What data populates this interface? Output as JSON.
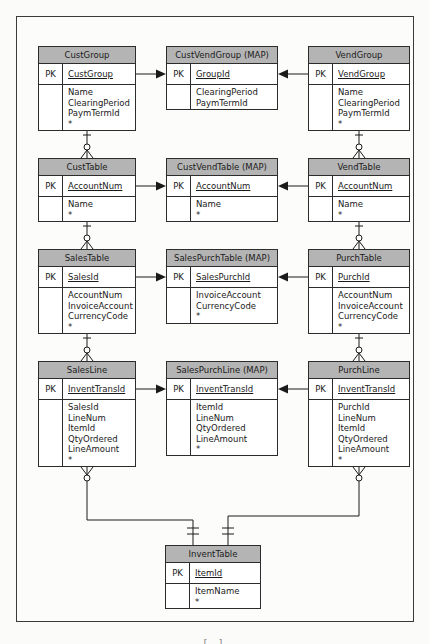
{
  "pk_label": "PK",
  "footer_fragment": "[ ]",
  "entities": [
    {
      "id": "custgroup",
      "name": "CustGroup",
      "pk": "CustGroup",
      "attrs": [
        "Name",
        "ClearingPeriod",
        "PaymTermId",
        "*"
      ]
    },
    {
      "id": "custvendgroup",
      "name": "CustVendGroup (MAP)",
      "pk": "GroupId",
      "attrs": [
        "ClearingPeriod",
        "PaymTermId"
      ]
    },
    {
      "id": "vendgroup",
      "name": "VendGroup",
      "pk": "VendGroup",
      "attrs": [
        "Name",
        "ClearingPeriod",
        "PaymTermId",
        "*"
      ]
    },
    {
      "id": "custtable",
      "name": "CustTable",
      "pk": "AccountNum",
      "attrs": [
        "Name",
        "*"
      ]
    },
    {
      "id": "custvendtable",
      "name": "CustVendTable (MAP)",
      "pk": "AccountNum",
      "attrs": [
        "Name",
        "*"
      ]
    },
    {
      "id": "vendtable",
      "name": "VendTable",
      "pk": "AccountNum",
      "attrs": [
        "Name",
        "*"
      ]
    },
    {
      "id": "salestable",
      "name": "SalesTable",
      "pk": "SalesId",
      "attrs": [
        "AccountNum",
        "InvoiceAccount",
        "CurrencyCode",
        "*"
      ]
    },
    {
      "id": "salespurchtable",
      "name": "SalesPurchTable (MAP)",
      "pk": "SalesPurchId",
      "attrs": [
        "InvoiceAccount",
        "CurrencyCode",
        "*"
      ]
    },
    {
      "id": "purchtable",
      "name": "PurchTable",
      "pk": "PurchId",
      "attrs": [
        "AccountNum",
        "InvoiceAccount",
        "CurrencyCode",
        "*"
      ]
    },
    {
      "id": "salesline",
      "name": "SalesLine",
      "pk": "InventTransId",
      "attrs": [
        "SalesId",
        "LineNum",
        "ItemId",
        "QtyOrdered",
        "LineAmount",
        "*"
      ]
    },
    {
      "id": "salespurchline",
      "name": "SalesPurchLine (MAP)",
      "pk": "InventTransId",
      "attrs": [
        "ItemId",
        "LineNum",
        "QtyOrdered",
        "LineAmount",
        "*"
      ]
    },
    {
      "id": "purchline",
      "name": "PurchLine",
      "pk": "InventTransId",
      "attrs": [
        "PurchId",
        "LineNum",
        "ItemId",
        "QtyOrdered",
        "LineAmount",
        "*"
      ]
    },
    {
      "id": "inventtable",
      "name": "InventTable",
      "pk": "ItemId",
      "attrs": [
        "ItemName",
        "*"
      ]
    }
  ],
  "relationships": [
    {
      "from": "CustGroup",
      "to": "CustVendGroup (MAP)",
      "type": "maps-to"
    },
    {
      "from": "VendGroup",
      "to": "CustVendGroup (MAP)",
      "type": "maps-to"
    },
    {
      "from": "CustTable",
      "to": "CustVendTable (MAP)",
      "type": "maps-to"
    },
    {
      "from": "VendTable",
      "to": "CustVendTable (MAP)",
      "type": "maps-to"
    },
    {
      "from": "SalesTable",
      "to": "SalesPurchTable (MAP)",
      "type": "maps-to"
    },
    {
      "from": "PurchTable",
      "to": "SalesPurchTable (MAP)",
      "type": "maps-to"
    },
    {
      "from": "SalesLine",
      "to": "SalesPurchLine (MAP)",
      "type": "maps-to"
    },
    {
      "from": "PurchLine",
      "to": "SalesPurchLine (MAP)",
      "type": "maps-to"
    },
    {
      "from": "CustGroup",
      "to": "CustTable",
      "type": "one-to-zero-or-many"
    },
    {
      "from": "CustTable",
      "to": "SalesTable",
      "type": "one-to-zero-or-many"
    },
    {
      "from": "SalesTable",
      "to": "SalesLine",
      "type": "one-to-zero-or-many"
    },
    {
      "from": "VendGroup",
      "to": "VendTable",
      "type": "one-to-zero-or-many"
    },
    {
      "from": "VendTable",
      "to": "PurchTable",
      "type": "one-to-zero-or-many"
    },
    {
      "from": "PurchTable",
      "to": "PurchLine",
      "type": "one-to-zero-or-many"
    },
    {
      "from": "SalesLine",
      "to": "InventTable",
      "type": "zero-or-many-to-exactly-one"
    },
    {
      "from": "PurchLine",
      "to": "InventTable",
      "type": "zero-or-many-to-exactly-one"
    }
  ]
}
